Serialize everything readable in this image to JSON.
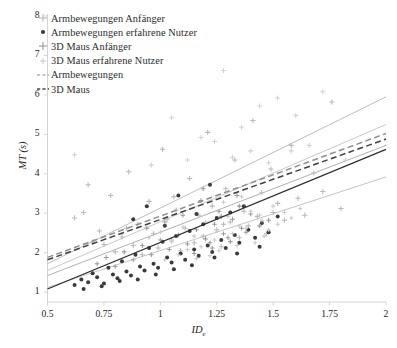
{
  "figure": {
    "background": "#ffffff",
    "frame_color": "#cfcfcf"
  },
  "axes": {
    "y": {
      "label": "MT (s)",
      "ticks": [
        1,
        2,
        3,
        4,
        5,
        6,
        7,
        8
      ],
      "tick_labels": [
        "1",
        "2",
        "3",
        "4",
        "5",
        "6",
        "7",
        "8"
      ],
      "min": 0.75,
      "max": 8.05
    },
    "x": {
      "label_main": "ID",
      "label_sub": "e",
      "ticks": [
        0.5,
        0.75,
        1,
        1.25,
        1.5,
        1.75,
        2
      ],
      "tick_labels": [
        "0.5",
        "0.75",
        "1",
        "1.25",
        "1.5",
        "1.75",
        "2"
      ],
      "min": 0.5,
      "max": 2.0
    }
  },
  "legend": {
    "items": [
      {
        "label": "Armbewegungen Anfänger",
        "marker": "plus",
        "color": "#b9b9b9",
        "icon": "plus-marker-icon"
      },
      {
        "label": "Armbewegungen erfahrene Nutzer",
        "marker": "dot",
        "color": "#3a3a3a",
        "icon": "filled-circle-marker-icon"
      },
      {
        "label": "3D Maus Anfänger",
        "marker": "plus",
        "color": "#9a9a9a",
        "icon": "plus-marker-icon"
      },
      {
        "label": "3D Maus erfahrene Nutzer",
        "marker": "plus-small",
        "color": "#c6c6c6",
        "icon": "plus-marker-icon"
      },
      {
        "label": "Armbewegungen",
        "marker": "dashed-line",
        "color": "#8e8e8e",
        "icon": "dashed-line-icon"
      },
      {
        "label": "3D Maus",
        "marker": "dashed-line",
        "color": "#4a4a4a",
        "icon": "dashed-line-icon"
      }
    ]
  },
  "chart_data": {
    "type": "scatter",
    "title": "",
    "xlabel": "ID_e",
    "ylabel": "MT (s)",
    "xlim": [
      0.5,
      2.0
    ],
    "ylim": [
      0.75,
      8.05
    ],
    "grid": false,
    "legend_position": "upper-left",
    "series": [
      {
        "name": "Armbewegungen Anfänger",
        "marker": "plus",
        "color": "#b9b9b9",
        "size": 5.2,
        "points": [
          [
            0.66,
            3.02
          ],
          [
            0.7,
            2.27
          ],
          [
            0.73,
            2.55
          ],
          [
            0.75,
            2.21
          ],
          [
            0.78,
            3.45
          ],
          [
            0.8,
            2.02
          ],
          [
            0.83,
            2.4
          ],
          [
            0.86,
            4.05
          ],
          [
            0.88,
            2.18
          ],
          [
            0.9,
            2.72
          ],
          [
            0.92,
            1.95
          ],
          [
            0.95,
            3.3
          ],
          [
            0.97,
            2.48
          ],
          [
            0.99,
            2.12
          ],
          [
            1.01,
            4.62
          ],
          [
            1.03,
            2.85
          ],
          [
            1.05,
            2.32
          ],
          [
            1.07,
            3.08
          ],
          [
            1.09,
            2.05
          ],
          [
            1.11,
            2.62
          ],
          [
            1.13,
            3.88
          ],
          [
            1.15,
            2.25
          ],
          [
            1.17,
            2.95
          ],
          [
            1.19,
            2.42
          ],
          [
            1.21,
            5.05
          ],
          [
            1.23,
            3.18
          ],
          [
            1.25,
            2.58
          ],
          [
            1.27,
            2.15
          ],
          [
            1.29,
            3.62
          ],
          [
            1.31,
            2.78
          ],
          [
            1.33,
            4.35
          ],
          [
            1.35,
            2.38
          ],
          [
            1.37,
            3.05
          ],
          [
            1.39,
            2.68
          ],
          [
            1.41,
            5.35
          ],
          [
            1.43,
            2.92
          ],
          [
            1.45,
            3.52
          ],
          [
            1.47,
            2.48
          ],
          [
            1.49,
            4.12
          ],
          [
            1.52,
            3.25
          ],
          [
            1.55,
            2.82
          ],
          [
            1.58,
            4.72
          ],
          [
            1.61,
            3.38
          ],
          [
            1.64,
            2.95
          ],
          [
            1.68,
            4.02
          ],
          [
            1.72,
            3.55
          ],
          [
            1.76,
            5.82
          ],
          [
            1.8,
            3.12
          ],
          [
            0.62,
            2.88
          ],
          [
            0.68,
            3.72
          ],
          [
            0.85,
            2.62
          ],
          [
            1.06,
            3.42
          ],
          [
            1.28,
            2.72
          ],
          [
            1.5,
            3.02
          ]
        ]
      },
      {
        "name": "Armbewegungen erfahrene Nutzer",
        "marker": "circle",
        "color": "#3a3a3a",
        "size": 3.2,
        "points": [
          [
            0.62,
            1.18
          ],
          [
            0.65,
            1.32
          ],
          [
            0.68,
            1.25
          ],
          [
            0.7,
            1.48
          ],
          [
            0.72,
            1.38
          ],
          [
            0.75,
            1.22
          ],
          [
            0.77,
            1.62
          ],
          [
            0.79,
            1.45
          ],
          [
            0.81,
            1.35
          ],
          [
            0.83,
            1.78
          ],
          [
            0.85,
            1.52
          ],
          [
            0.87,
            1.42
          ],
          [
            0.89,
            1.95
          ],
          [
            0.91,
            1.65
          ],
          [
            0.93,
            1.55
          ],
          [
            0.95,
            2.12
          ],
          [
            0.97,
            1.72
          ],
          [
            0.99,
            1.62
          ],
          [
            1.01,
            2.28
          ],
          [
            1.03,
            1.88
          ],
          [
            1.05,
            1.75
          ],
          [
            1.07,
            2.42
          ],
          [
            1.09,
            1.98
          ],
          [
            1.11,
            1.82
          ],
          [
            1.13,
            2.55
          ],
          [
            1.15,
            2.08
          ],
          [
            1.17,
            1.92
          ],
          [
            1.19,
            2.72
          ],
          [
            1.21,
            2.18
          ],
          [
            1.23,
            2.02
          ],
          [
            1.25,
            2.88
          ],
          [
            1.27,
            2.32
          ],
          [
            1.29,
            2.12
          ],
          [
            1.31,
            3.02
          ],
          [
            1.33,
            2.45
          ],
          [
            1.35,
            2.25
          ],
          [
            1.37,
            3.18
          ],
          [
            1.39,
            2.58
          ],
          [
            1.42,
            2.38
          ],
          [
            1.45,
            2.75
          ],
          [
            1.48,
            2.52
          ],
          [
            1.52,
            2.92
          ],
          [
            1.22,
            3.72
          ],
          [
            0.94,
            3.18
          ],
          [
            1.08,
            3.45
          ],
          [
            1.16,
            2.98
          ],
          [
            0.88,
            2.85
          ],
          [
            1.02,
            2.68
          ],
          [
            0.66,
            1.08
          ],
          [
            0.74,
            1.15
          ],
          [
            0.82,
            1.28
          ],
          [
            0.9,
            1.32
          ],
          [
            0.98,
            1.45
          ],
          [
            1.06,
            1.58
          ],
          [
            1.14,
            1.68
          ],
          [
            1.24,
            1.88
          ],
          [
            1.34,
            1.98
          ],
          [
            1.44,
            2.15
          ]
        ]
      },
      {
        "name": "3D Maus Anfänger",
        "marker": "plus",
        "color": "#9a9a9a",
        "size": 4.6,
        "points": [
          [
            0.72,
            1.72
          ],
          [
            0.76,
            1.88
          ],
          [
            0.8,
            1.65
          ],
          [
            0.84,
            2.02
          ],
          [
            0.88,
            1.82
          ],
          [
            0.92,
            2.18
          ],
          [
            0.96,
            1.95
          ],
          [
            1.0,
            2.32
          ],
          [
            1.04,
            2.08
          ],
          [
            1.08,
            2.45
          ],
          [
            1.12,
            2.22
          ],
          [
            1.16,
            2.58
          ],
          [
            1.2,
            2.35
          ],
          [
            1.24,
            2.72
          ],
          [
            1.28,
            2.48
          ],
          [
            1.32,
            2.85
          ],
          [
            1.36,
            2.62
          ],
          [
            1.4,
            2.98
          ],
          [
            1.18,
            3.32
          ],
          [
            1.26,
            3.05
          ],
          [
            1.34,
            3.45
          ],
          [
            1.1,
            2.95
          ],
          [
            1.02,
            2.78
          ],
          [
            0.94,
            2.62
          ],
          [
            1.22,
            2.25
          ],
          [
            1.3,
            2.38
          ],
          [
            1.38,
            2.52
          ],
          [
            1.44,
            2.68
          ],
          [
            1.48,
            2.82
          ],
          [
            1.15,
            1.98
          ],
          [
            1.23,
            2.12
          ],
          [
            1.31,
            2.28
          ],
          [
            1.19,
            3.62
          ],
          [
            1.27,
            2.92
          ],
          [
            1.35,
            3.18
          ]
        ]
      },
      {
        "name": "3D Maus erfahrene Nutzer",
        "marker": "plus",
        "color": "#c9c9c9",
        "size": 4.2,
        "points": [
          [
            0.95,
            2.38
          ],
          [
            1.0,
            2.52
          ],
          [
            1.05,
            2.28
          ],
          [
            1.1,
            2.65
          ],
          [
            1.15,
            2.42
          ],
          [
            1.2,
            2.78
          ],
          [
            1.25,
            2.55
          ],
          [
            1.3,
            2.92
          ],
          [
            1.35,
            2.68
          ],
          [
            1.4,
            3.05
          ],
          [
            1.45,
            2.82
          ],
          [
            1.5,
            3.18
          ],
          [
            1.18,
            2.15
          ],
          [
            1.24,
            2.32
          ],
          [
            1.32,
            2.48
          ],
          [
            1.38,
            2.62
          ],
          [
            1.42,
            2.25
          ],
          [
            1.46,
            2.42
          ],
          [
            1.28,
            3.28
          ],
          [
            1.36,
            3.42
          ],
          [
            1.22,
            1.92
          ],
          [
            1.26,
            2.05
          ],
          [
            1.34,
            2.18
          ],
          [
            1.44,
            2.95
          ],
          [
            1.48,
            2.58
          ],
          [
            1.52,
            2.72
          ],
          [
            1.12,
            2.08
          ],
          [
            1.16,
            1.85
          ],
          [
            1.08,
            1.95
          ],
          [
            1.02,
            1.82
          ],
          [
            1.55,
            3.02
          ],
          [
            1.58,
            2.88
          ],
          [
            1.62,
            3.12
          ]
        ]
      },
      {
        "name": "outliers-high",
        "marker": "plus",
        "color": "#d2d2d2",
        "size": 5.0,
        "points": [
          [
            1.28,
            6.62
          ],
          [
            1.52,
            5.92
          ],
          [
            1.6,
            5.48
          ],
          [
            1.44,
            5.72
          ],
          [
            1.36,
            5.18
          ],
          [
            1.72,
            6.08
          ],
          [
            1.05,
            5.42
          ],
          [
            1.18,
            4.92
          ],
          [
            1.58,
            4.58
          ],
          [
            0.62,
            4.48
          ],
          [
            1.66,
            4.72
          ],
          [
            1.82,
            4.35
          ],
          [
            1.24,
            4.82
          ],
          [
            1.32,
            4.42
          ],
          [
            1.48,
            4.28
          ],
          [
            1.4,
            4.58
          ],
          [
            1.12,
            4.35
          ],
          [
            0.96,
            4.22
          ]
        ]
      }
    ],
    "trend_lines": [
      {
        "name": "3D Maus Anfänger fit",
        "style": "solid",
        "color": "#b5b5b5",
        "width": 0.9,
        "x0": 0.5,
        "y0": 1.72,
        "x1": 2.0,
        "y1": 5.95
      },
      {
        "name": "Armbewegungen Anfänger fit",
        "style": "solid",
        "color": "#c2c2c2",
        "width": 0.9,
        "x0": 0.5,
        "y0": 1.55,
        "x1": 2.0,
        "y1": 5.25
      },
      {
        "name": "Armbewegungen",
        "style": "dashed",
        "color": "#8e8e8e",
        "width": 1.5,
        "x0": 0.5,
        "y0": 1.88,
        "x1": 2.0,
        "y1": 5.02
      },
      {
        "name": "3D Maus",
        "style": "dashed",
        "color": "#3f3f3f",
        "width": 1.5,
        "x0": 0.5,
        "y0": 1.82,
        "x1": 2.0,
        "y1": 4.88
      },
      {
        "name": "3D Maus erfahrene fit",
        "style": "solid",
        "color": "#a8a8a8",
        "width": 0.9,
        "x0": 0.5,
        "y0": 1.42,
        "x1": 2.0,
        "y1": 4.72
      },
      {
        "name": "Armbewegungen erfahrene fit",
        "style": "solid",
        "color": "#2e2e2e",
        "width": 1.3,
        "x0": 0.5,
        "y0": 1.08,
        "x1": 2.0,
        "y1": 4.62
      },
      {
        "name": "lower reference fit",
        "style": "solid",
        "color": "#bdbdbd",
        "width": 0.9,
        "x0": 0.5,
        "y0": 1.12,
        "x1": 2.0,
        "y1": 3.92
      }
    ]
  }
}
